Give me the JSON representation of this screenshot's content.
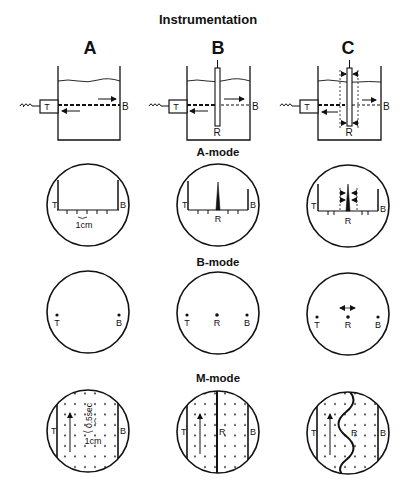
{
  "title": "Instrumentation",
  "columns": [
    {
      "label": "A",
      "x": 90
    },
    {
      "label": "B",
      "x": 218
    },
    {
      "label": "C",
      "x": 348
    }
  ],
  "tank_labels": {
    "transducer": "T",
    "back_wall": "B",
    "reflector": "R"
  },
  "modes": [
    {
      "label": "A-mode",
      "y": 146
    },
    {
      "label": "B-mode",
      "y": 256
    },
    {
      "label": "M-mode",
      "y": 372
    }
  ],
  "annotations": {
    "a_mode_scale": "1cm",
    "m_mode_time_scale": "0.5sec",
    "m_mode_distance_scale": "1cm"
  },
  "colors": {
    "ink": "#111111",
    "background": "#ffffff"
  }
}
